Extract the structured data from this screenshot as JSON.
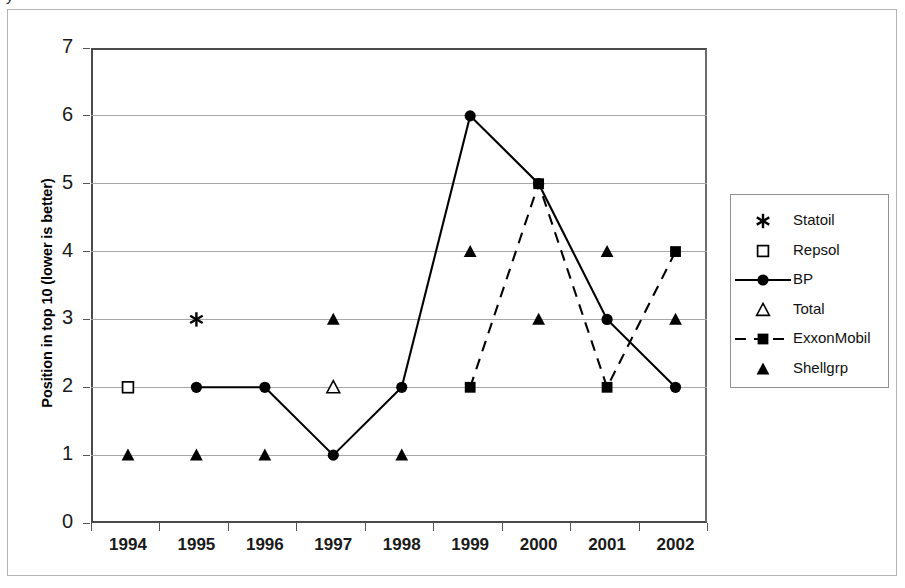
{
  "page_fragment": "y",
  "chart_data": {
    "type": "line",
    "title": "",
    "subtitle": "",
    "xlabel": "",
    "ylabel": "Position in top 10 (lower is better)",
    "categories": [
      "1994",
      "1995",
      "1996",
      "1997",
      "1998",
      "1999",
      "2000",
      "2001",
      "2002"
    ],
    "x_tick_labels": [
      "1994",
      "1995",
      "1996",
      "1997",
      "1998",
      "1999",
      "2000",
      "2001",
      "2002"
    ],
    "y_tick_labels": [
      "0",
      "1",
      "2",
      "3",
      "4",
      "5",
      "6",
      "7"
    ],
    "ylim": [
      0,
      7
    ],
    "y_ticks": [
      0,
      1,
      2,
      3,
      4,
      5,
      6,
      7
    ],
    "grid": true,
    "grid_axis": "y",
    "legend_position": "right",
    "annotations": [],
    "series": [
      {
        "name": "Statoil",
        "marker": "asterisk",
        "marker_filled": true,
        "line": "none",
        "color": "#000000",
        "values": [
          null,
          3,
          null,
          null,
          null,
          null,
          null,
          null,
          null
        ]
      },
      {
        "name": "Repsol",
        "marker": "square-open",
        "marker_filled": false,
        "line": "none",
        "color": "#000000",
        "values": [
          2,
          null,
          null,
          null,
          null,
          null,
          null,
          null,
          null
        ]
      },
      {
        "name": "BP",
        "marker": "circle",
        "marker_filled": true,
        "line": "solid",
        "color": "#000000",
        "values": [
          null,
          2,
          2,
          1,
          2,
          6,
          5,
          3,
          2
        ]
      },
      {
        "name": "Total",
        "marker": "triangle-open",
        "marker_filled": false,
        "line": "none",
        "color": "#000000",
        "values": [
          null,
          null,
          null,
          2,
          null,
          null,
          null,
          null,
          null
        ]
      },
      {
        "name": "ExxonMobil",
        "marker": "square",
        "marker_filled": true,
        "line": "dashed",
        "color": "#000000",
        "values": [
          null,
          null,
          null,
          null,
          null,
          2,
          5,
          2,
          4
        ]
      },
      {
        "name": "Shellgrp",
        "marker": "triangle",
        "marker_filled": true,
        "line": "none",
        "color": "#000000",
        "values": [
          1,
          1,
          1,
          3,
          1,
          4,
          3,
          4,
          3
        ]
      }
    ]
  },
  "legend": {
    "items": [
      {
        "label": "Statoil",
        "symbol": "asterisk-marker"
      },
      {
        "label": "Repsol",
        "symbol": "open-square-marker"
      },
      {
        "label": "BP",
        "symbol": "solid-line-circle-marker"
      },
      {
        "label": "Total",
        "symbol": "open-triangle-marker"
      },
      {
        "label": "ExxonMobil",
        "symbol": "dashed-line-square-marker"
      },
      {
        "label": "Shellgrp",
        "symbol": "filled-triangle-marker"
      }
    ]
  },
  "colors": {
    "ink": "#000000",
    "gridline": "#a8a8a8",
    "axis": "#4a4a4a",
    "border": "#b4b4b4",
    "background": "#ffffff"
  }
}
